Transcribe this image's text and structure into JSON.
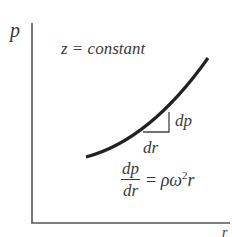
{
  "diagram": {
    "y_axis_label": "p",
    "x_axis_label": "r",
    "condition": "z = constant",
    "triangle": {
      "rise_label": "dp",
      "run_label": "dr"
    },
    "equation": {
      "numerator": "dp",
      "denominator": "dr",
      "rhs_equals": "=",
      "rhs_rho_omega": "ρω",
      "rhs_exponent": "2",
      "rhs_r": "r"
    },
    "colors": {
      "axis": "#555555",
      "curve": "#222222",
      "text": "#3a3a3a"
    }
  }
}
